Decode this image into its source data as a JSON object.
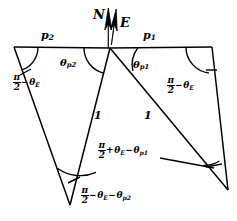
{
  "figure": {
    "type": "geometry-diagram",
    "width": 237,
    "height": 221,
    "background": "#ffffff",
    "stroke": "#000000"
  },
  "compass": {
    "north_label": "N",
    "east_label": "E",
    "north_arrow": "north-arrow",
    "east_arrow": "east-arrow"
  },
  "edges": {
    "p1_label": "p",
    "p1_sub": "1",
    "p2_label": "p",
    "p2_sub": "2",
    "unit_left_label": "1",
    "unit_right_label": "1"
  },
  "angles": {
    "theta_p2": {
      "sym": "θ",
      "sub": "p2"
    },
    "theta_p1": {
      "sym": "θ",
      "sub": "p1"
    },
    "top_left": {
      "num": "π",
      "den": "2",
      "op": "−",
      "sym": "θ",
      "sub": "E"
    },
    "top_right": {
      "num": "π",
      "den": "2",
      "op": "−",
      "sym": "θ",
      "sub": "E"
    },
    "bottom_left": {
      "num": "π",
      "den": "2",
      "op1": "−",
      "sym1": "θ",
      "sub1": "E",
      "op2": "−",
      "sym2": "θ",
      "sub2": "p2"
    },
    "bottom_right": {
      "num": "π",
      "den": "2",
      "op1": "+",
      "sym1": "θ",
      "sub1": "E",
      "op2": "−",
      "sym2": "θ",
      "sub2": "p1"
    }
  },
  "vertices": {
    "apex": {
      "x": 110,
      "y": 48
    },
    "top_left": {
      "x": 14,
      "y": 47
    },
    "top_right": {
      "x": 212,
      "y": 47
    },
    "bottom_left": {
      "x": 70,
      "y": 205
    },
    "bottom_right": {
      "x": 228,
      "y": 190
    }
  }
}
